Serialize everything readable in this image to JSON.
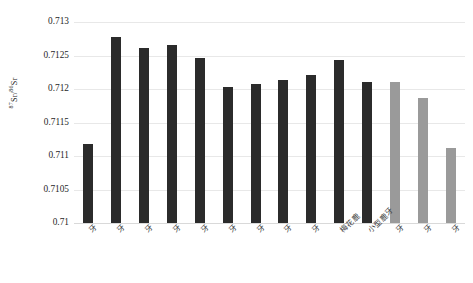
{
  "chart_data": {
    "type": "bar",
    "title": "",
    "xlabel": "",
    "ylabel": "87Sr/86Sr",
    "ylabel_parts": {
      "sup1": "87",
      "base1": "Sr/",
      "sup2": "86",
      "base2": "Sr"
    },
    "ylim": [
      0.71,
      0.713
    ],
    "ytick_labels": [
      "0.713",
      "0.7125",
      "0.712",
      "0.7115",
      "0.711",
      "0.7105",
      "0.71"
    ],
    "ytick_values": [
      0.713,
      0.7125,
      0.712,
      0.7115,
      0.711,
      0.7105,
      0.71
    ],
    "grid": true,
    "legend": "none",
    "categories": [
      "牙",
      "牙",
      "牙",
      "牙",
      "牙",
      "牙",
      "牙",
      "牙",
      "牙",
      "梅花鹿",
      "小型鹿牙",
      "牙",
      "牙",
      "牙"
    ],
    "bars": [
      {
        "label": "牙",
        "value": 0.71118,
        "color": "#2b2b2b",
        "group": "dark"
      },
      {
        "label": "牙",
        "value": 0.71278,
        "color": "#2b2b2b",
        "group": "dark"
      },
      {
        "label": "牙",
        "value": 0.71261,
        "color": "#2b2b2b",
        "group": "dark"
      },
      {
        "label": "牙",
        "value": 0.71265,
        "color": "#2b2b2b",
        "group": "dark"
      },
      {
        "label": "牙",
        "value": 0.71246,
        "color": "#2b2b2b",
        "group": "dark"
      },
      {
        "label": "牙",
        "value": 0.71203,
        "color": "#2b2b2b",
        "group": "dark"
      },
      {
        "label": "牙",
        "value": 0.71208,
        "color": "#2b2b2b",
        "group": "dark"
      },
      {
        "label": "牙",
        "value": 0.71213,
        "color": "#2b2b2b",
        "group": "dark"
      },
      {
        "label": "牙",
        "value": 0.71221,
        "color": "#2b2b2b",
        "group": "dark"
      },
      {
        "label": "梅花鹿",
        "value": 0.71243,
        "color": "#2b2b2b",
        "group": "dark"
      },
      {
        "label": "小型鹿牙",
        "value": 0.71211,
        "color": "#2b2b2b",
        "group": "dark"
      },
      {
        "label": "牙",
        "value": 0.71211,
        "color": "#9a9a9a",
        "group": "light"
      },
      {
        "label": "牙",
        "value": 0.71187,
        "color": "#9a9a9a",
        "group": "light"
      },
      {
        "label": "牙",
        "value": 0.71112,
        "color": "#9a9a9a",
        "group": "light"
      }
    ],
    "colors": {
      "dark_series": "#2b2b2b",
      "light_series": "#9a9a9a",
      "gridline": "#e8e8e8",
      "text": "#1f1f1f"
    }
  }
}
